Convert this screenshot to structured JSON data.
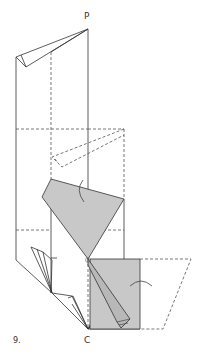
{
  "diagram": {
    "step_number": "9.",
    "point_labels": {
      "top": "P",
      "bottom": "C"
    },
    "colors": {
      "line": "#333333",
      "fill": "#c8c8c8",
      "dashed": "#555555",
      "background": "#ffffff"
    },
    "annotations": [
      "rotation-arrow-upper",
      "rotation-arrow-lower"
    ]
  }
}
